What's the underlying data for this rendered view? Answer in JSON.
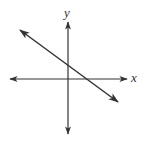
{
  "diagram": {
    "type": "coordinate-plane-line-graph",
    "axes": {
      "x_label": "x",
      "y_label": "y",
      "origin_px": [
        68,
        79
      ],
      "x_axis_px": {
        "from": [
          10,
          79
        ],
        "to": [
          127,
          79
        ]
      },
      "y_axis_px": {
        "from": [
          68,
          22
        ],
        "to": [
          68,
          134
        ]
      }
    },
    "line": {
      "description": "line with negative slope, positive y-intercept and positive x-intercept",
      "from_px": [
        20,
        30
      ],
      "to_px": [
        118,
        102
      ],
      "slope_sign": "negative",
      "y_intercept_sign": "positive",
      "x_intercept_sign": "positive"
    },
    "colors": {
      "stroke": "#333333",
      "background": "#ffffff"
    }
  }
}
